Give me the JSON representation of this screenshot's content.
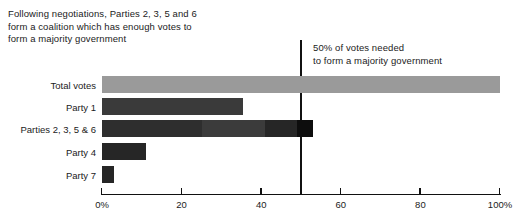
{
  "annotations": {
    "coalition_note": "Following negotiations, Parties 2, 3, 5 and 6\nform a coalition which has enough votes to\nform a majority government",
    "majority_note": "50% of votes needed\nto form a majority government"
  },
  "chart_data": {
    "type": "bar",
    "orientation": "horizontal",
    "title": "",
    "xlabel": "",
    "ylabel": "",
    "xlim": [
      0,
      100
    ],
    "grid": false,
    "legend": "none",
    "categories": [
      "Total votes",
      "Party 1",
      "Parties 2, 3, 5 & 6",
      "Party 4",
      "Party 7"
    ],
    "values": [
      100,
      35.5,
      53,
      11,
      3
    ],
    "tick_labels": [
      "0%",
      "20",
      "40",
      "60",
      "80",
      "100%"
    ],
    "tick_values": [
      0,
      20,
      40,
      60,
      80,
      100
    ],
    "reference_line": {
      "value": 50,
      "label": "50% of votes needed to form a majority government"
    },
    "bars": [
      {
        "category": "Total votes",
        "total": 100,
        "segments": [
          {
            "name": "total-votes",
            "value": 100,
            "color": "#9a9a9a"
          }
        ]
      },
      {
        "category": "Party 1",
        "total": 35.5,
        "segments": [
          {
            "name": "party-1",
            "value": 35.5,
            "color": "#3a3a3a"
          }
        ]
      },
      {
        "category": "Parties 2, 3, 5 & 6",
        "total": 53,
        "segments": [
          {
            "name": "party-2",
            "value": 25,
            "color": "#2e2e2e"
          },
          {
            "name": "party-3",
            "value": 16,
            "color": "#3b3b3b"
          },
          {
            "name": "party-5",
            "value": 8,
            "color": "#262626"
          },
          {
            "name": "party-6",
            "value": 4,
            "color": "#0d0d0d"
          }
        ]
      },
      {
        "category": "Party 4",
        "total": 11,
        "segments": [
          {
            "name": "party-4",
            "value": 11,
            "color": "#262626"
          }
        ]
      },
      {
        "category": "Party 7",
        "total": 3,
        "segments": [
          {
            "name": "party-7",
            "value": 3,
            "color": "#262626"
          }
        ]
      }
    ]
  },
  "colors": {
    "axis": "#111111",
    "reference_line": "#111111",
    "text": "#1b1b1b",
    "background": "#ffffff"
  }
}
